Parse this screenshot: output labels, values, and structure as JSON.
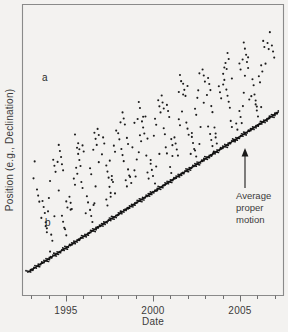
{
  "figure": {
    "background_color": "#f3f2f0",
    "frame_color": "#8a8a8a",
    "ink_color": "#1c1c1c"
  },
  "axes": {
    "x_title": "Date",
    "y_title": "Position (e.g., Declination)",
    "x_tick_labels": [
      "1995",
      "2000",
      "2005"
    ],
    "x_major_ticks": [
      1995,
      2000,
      2005
    ],
    "x_minor_tick_count": 18
  },
  "panel_labels": {
    "upper": "a",
    "lower": "b"
  },
  "annotations": [
    {
      "name": "average-proper-motion",
      "line1": "Average",
      "line2": "proper",
      "line3": "motion",
      "full_text": "Average proper motion"
    }
  ],
  "chart_data": {
    "type": "scatter",
    "title": "",
    "xlabel": "Date",
    "ylabel": "Position (e.g., Declination)",
    "xlim": [
      1992.5,
      2007.5
    ],
    "ylim": [
      0,
      100
    ],
    "grid": false,
    "legend": "none",
    "series": [
      {
        "name": "a",
        "label": "a",
        "description": "Position with parallax wobble plus proper motion (scattered points)",
        "marker": "dot",
        "x": [
          1993.4,
          1993.5,
          1993.65,
          1993.8,
          1993.95,
          1994.1,
          1994.25,
          1994.4,
          1994.55,
          1994.7,
          1994.85,
          1995.0,
          1995.15,
          1995.3,
          1995.45,
          1995.6,
          1995.75,
          1995.9,
          1996.05,
          1996.2,
          1996.35,
          1996.5,
          1996.65,
          1996.8,
          1996.95,
          1997.1,
          1997.25,
          1997.4,
          1997.55,
          1997.7,
          1997.85,
          1998.0,
          1998.15,
          1998.3,
          1998.45,
          1998.6,
          1998.75,
          1998.9,
          1999.05,
          1999.2,
          1999.35,
          1999.5,
          1999.65,
          1999.8,
          1999.95,
          2000.1,
          2000.25,
          2000.4,
          2000.55,
          2000.7,
          2000.85,
          2001.0,
          2001.15,
          2001.3,
          2001.45,
          2001.6,
          2001.75,
          2001.9,
          2002.05,
          2002.2,
          2002.35,
          2002.5,
          2002.65,
          2002.8,
          2002.95,
          2003.1,
          2003.25,
          2003.4,
          2003.55,
          2003.7,
          2003.85,
          2004.0,
          2004.15,
          2004.3,
          2004.45,
          2004.6,
          2004.75,
          2004.9,
          2005.05,
          2005.2,
          2005.35,
          2005.5,
          2005.65,
          2005.8,
          2005.95,
          2006.1,
          2006.25,
          2006.4,
          2006.55,
          2006.7
        ],
        "y": [
          44,
          36,
          30,
          23,
          18,
          26,
          36,
          45,
          48,
          43,
          34,
          27,
          24,
          31,
          41,
          49,
          52,
          47,
          39,
          32,
          29,
          35,
          45,
          53,
          56,
          51,
          43,
          36,
          33,
          39,
          49,
          57,
          60,
          55,
          47,
          40,
          37,
          43,
          53,
          61,
          64,
          59,
          51,
          44,
          41,
          47,
          57,
          65,
          68,
          63,
          55,
          48,
          45,
          51,
          61,
          69,
          72,
          67,
          59,
          52,
          49,
          55,
          65,
          73,
          76,
          71,
          63,
          56,
          53,
          59,
          69,
          77,
          80,
          75,
          67,
          60,
          57,
          63,
          73,
          81,
          84,
          79,
          71,
          64,
          61,
          67,
          77,
          85,
          88,
          83
        ]
      },
      {
        "name": "b",
        "label": "b",
        "description": "Position after parallax removal; tight linear proper motion trend",
        "marker": "dot-dense",
        "trend": {
          "x_start": 1992.8,
          "y_start": 8,
          "x_end": 2007.2,
          "y_end": 63
        }
      }
    ]
  }
}
